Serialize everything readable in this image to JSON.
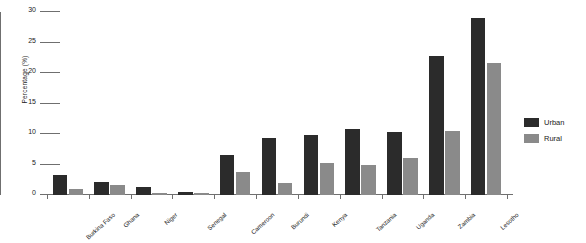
{
  "chart_data": {
    "type": "bar",
    "title": "",
    "subtitle": "",
    "xlabel": "",
    "ylabel": "Percentage (%)",
    "ylim": [
      0,
      30
    ],
    "yticks": [
      0,
      5,
      10,
      15,
      20,
      25,
      30
    ],
    "ytick_labels": [
      "0",
      "5",
      "10",
      "15",
      "20",
      "25",
      "30"
    ],
    "grid": false,
    "legend_position": "right",
    "categories": [
      "Burkina Faso",
      "Ghana",
      "Niger",
      "Senegal",
      "Cameroon",
      "Burundi",
      "Kenya",
      "Tanzania",
      "Uganda",
      "Zambia",
      "Lesotho"
    ],
    "series": [
      {
        "name": "Urban",
        "color": "#2b2b2b",
        "values": [
          3.3,
          2.1,
          1.3,
          0.5,
          6.5,
          9.3,
          9.9,
          10.8,
          10.4,
          22.8,
          29.0
        ]
      },
      {
        "name": "Rural",
        "color": "#8a8a8a",
        "values": [
          1.0,
          1.6,
          0.4,
          0.4,
          3.7,
          2.0,
          5.2,
          5.0,
          6.0,
          10.5,
          21.6
        ]
      }
    ]
  },
  "legend": {
    "items": [
      {
        "label": "Urban",
        "color": "#2b2b2b"
      },
      {
        "label": "Rural",
        "color": "#8a8a8a"
      }
    ]
  },
  "axis": {
    "y_title": "Percentage (%)"
  }
}
